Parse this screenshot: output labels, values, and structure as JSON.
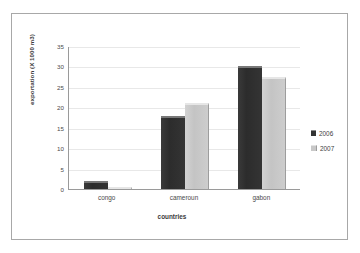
{
  "chart_data": {
    "type": "bar",
    "title": "",
    "subtitle": "",
    "xlabel": "countries",
    "ylabel": "exportation (X 1000 m3)",
    "categories": [
      "congo",
      "cameroun",
      "gabon"
    ],
    "series": [
      {
        "name": "2006",
        "values": [
          2,
          17.8,
          30
        ],
        "color": "#333333"
      },
      {
        "name": "2007",
        "values": [
          0.3,
          21,
          27.5
        ],
        "color": "#c8c8c8"
      }
    ],
    "ylim": [
      0,
      35
    ],
    "yticks": [
      0,
      5,
      10,
      15,
      20,
      25,
      30,
      35
    ],
    "ytick_labels": [
      "0",
      "5",
      "10",
      "15",
      "20",
      "25",
      "30",
      "35"
    ],
    "grid": true,
    "grid_axis": "y",
    "legend_position": "right",
    "legend_entries": [
      "2006",
      "2007"
    ],
    "annotations": []
  },
  "frame": {
    "border_color": "#a8a8a8",
    "background": "#ffffff"
  }
}
